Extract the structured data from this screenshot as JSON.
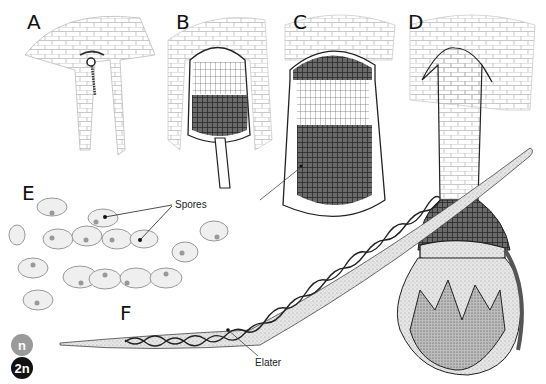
{
  "figure": {
    "panels": [
      {
        "id": "A",
        "label": "A"
      },
      {
        "id": "B",
        "label": "B"
      },
      {
        "id": "C",
        "label": "C"
      },
      {
        "id": "D",
        "label": "D"
      },
      {
        "id": "E",
        "label": "E"
      },
      {
        "id": "F",
        "label": "F"
      }
    ],
    "annotations": {
      "spores": "Spores",
      "elater": "Elater"
    },
    "legend": [
      {
        "symbol": "n",
        "meaning": "haploid",
        "color": "#9a9a9a"
      },
      {
        "symbol": "2n",
        "meaning": "diploid",
        "color": "#111111"
      }
    ]
  }
}
